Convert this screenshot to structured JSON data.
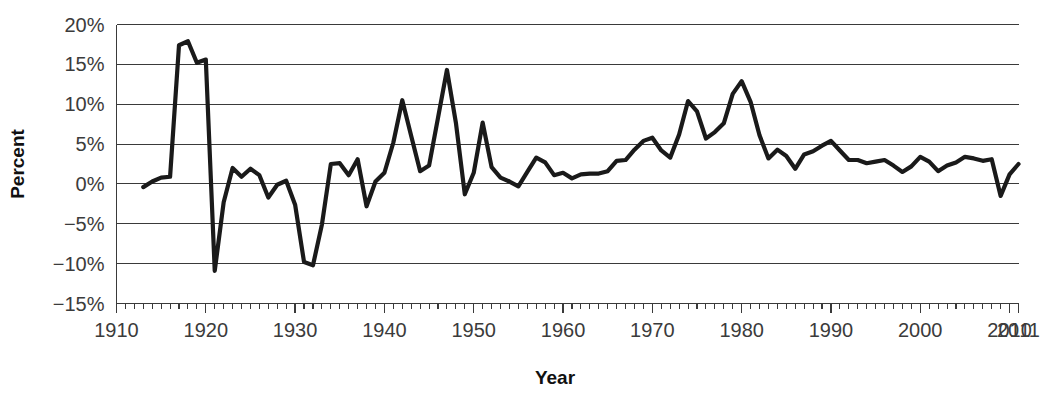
{
  "chart_data": {
    "type": "line",
    "title": "",
    "xlabel": "Year",
    "ylabel": "Percent",
    "xlim": [
      1910,
      2011
    ],
    "ylim": [
      -15,
      20
    ],
    "grid": true,
    "grid_axis": "y",
    "legend": "none",
    "line_color": "#1a1a1a",
    "grid_color": "#3a3a3a",
    "axis_color": "#3a3a3a",
    "ytick_labels": [
      "20%",
      "15%",
      "10%",
      "5%",
      "0%",
      "−5%",
      "−10%",
      "−15%"
    ],
    "ytick_values": [
      20,
      15,
      10,
      5,
      0,
      -5,
      -10,
      -15
    ],
    "xtick_labels": [
      "1910",
      "1920",
      "1930",
      "1940",
      "1950",
      "1960",
      "1970",
      "1980",
      "1990",
      "2000",
      "2010",
      "2011"
    ],
    "xtick_values": [
      1910,
      1920,
      1930,
      1940,
      1950,
      1960,
      1970,
      1980,
      1990,
      2000,
      2010,
      2011
    ],
    "xtick_minor_step": 1,
    "x": [
      1913,
      1914,
      1915,
      1916,
      1917,
      1918,
      1919,
      1920,
      1921,
      1922,
      1923,
      1924,
      1925,
      1926,
      1927,
      1928,
      1929,
      1930,
      1931,
      1932,
      1933,
      1934,
      1935,
      1936,
      1937,
      1938,
      1939,
      1940,
      1941,
      1942,
      1943,
      1944,
      1945,
      1946,
      1947,
      1948,
      1949,
      1950,
      1951,
      1952,
      1953,
      1954,
      1955,
      1956,
      1957,
      1958,
      1959,
      1960,
      1961,
      1962,
      1963,
      1964,
      1965,
      1966,
      1967,
      1968,
      1969,
      1970,
      1971,
      1972,
      1973,
      1974,
      1975,
      1976,
      1977,
      1978,
      1979,
      1980,
      1981,
      1982,
      1983,
      1984,
      1985,
      1986,
      1987,
      1988,
      1989,
      1990,
      1991,
      1992,
      1993,
      1994,
      1995,
      1996,
      1997,
      1998,
      1999,
      2000,
      2001,
      2002,
      2003,
      2004,
      2005,
      2006,
      2007,
      2008,
      2009,
      2010,
      2011
    ],
    "y": [
      -0.4,
      0.3,
      0.8,
      0.9,
      17.4,
      17.9,
      15.2,
      15.6,
      -10.9,
      -2.3,
      2.0,
      0.9,
      1.9,
      1.1,
      -1.7,
      -0.1,
      0.4,
      -2.6,
      -9.8,
      -10.2,
      -5.1,
      2.5,
      2.6,
      1.1,
      3.1,
      -2.8,
      0.3,
      1.4,
      5.2,
      10.5,
      6.0,
      1.6,
      2.3,
      8.3,
      14.3,
      7.7,
      -1.3,
      1.4,
      7.7,
      2.1,
      0.8,
      0.3,
      -0.3,
      1.5,
      3.3,
      2.7,
      1.1,
      1.4,
      0.7,
      1.2,
      1.3,
      1.3,
      1.6,
      2.9,
      3.0,
      4.3,
      5.4,
      5.8,
      4.2,
      3.3,
      6.2,
      10.4,
      9.1,
      5.7,
      6.5,
      7.6,
      11.3,
      12.9,
      10.3,
      6.1,
      3.2,
      4.3,
      3.5,
      1.9,
      3.7,
      4.1,
      4.8,
      5.4,
      4.2,
      3.0,
      3.0,
      2.6,
      2.8,
      3.0,
      2.3,
      1.5,
      2.2,
      3.4,
      2.8,
      1.6,
      2.3,
      2.7,
      3.4,
      3.2,
      2.9,
      3.1,
      -1.5,
      1.2,
      2.5
    ],
    "annotations": []
  }
}
